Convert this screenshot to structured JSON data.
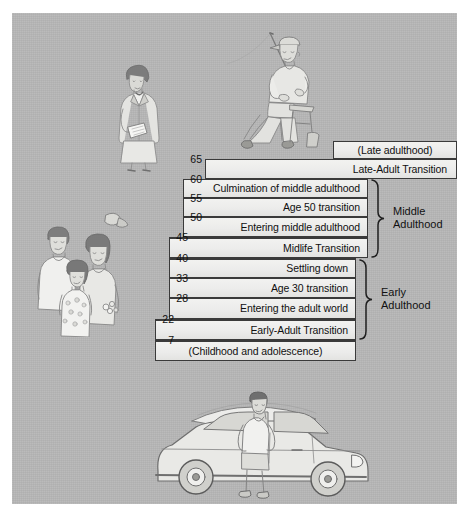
{
  "figure": {
    "background_color": "#b6b6b6",
    "bar_fill_color": "#ececea",
    "bar_border_color": "#3a3a3a"
  },
  "age_ticks": [
    {
      "value": "65"
    },
    {
      "value": "60"
    },
    {
      "value": "55"
    },
    {
      "value": "50"
    },
    {
      "value": "45"
    },
    {
      "value": "40"
    },
    {
      "value": "33"
    },
    {
      "value": "28"
    },
    {
      "value": "22"
    },
    {
      "value": "7"
    }
  ],
  "stages": [
    {
      "id": "late-adulthood",
      "label": "(Late adulthood)"
    },
    {
      "id": "late-adult-transition",
      "label": "Late-Adult Transition"
    },
    {
      "id": "culmination-middle",
      "label": "Culmination of middle adulthood"
    },
    {
      "id": "age-50-transition",
      "label": "Age 50 transition"
    },
    {
      "id": "entering-middle-adulthood",
      "label": "Entering middle adulthood"
    },
    {
      "id": "midlife-transition",
      "label": "Midlife Transition"
    },
    {
      "id": "settling-down",
      "label": "Settling down"
    },
    {
      "id": "age-30-transition",
      "label": "Age 30 transition"
    },
    {
      "id": "entering-adult-world",
      "label": "Entering the adult world"
    },
    {
      "id": "early-adult-transition",
      "label": "Early-Adult Transition"
    },
    {
      "id": "childhood-adolescence",
      "label": "(Childhood and adolescence)"
    }
  ],
  "era_labels": [
    {
      "id": "middle-adulthood",
      "line1": "Middle",
      "line2": "Adulthood"
    },
    {
      "id": "early-adulthood",
      "line1": "Early",
      "line2": "Adulthood"
    }
  ],
  "illustrations": [
    {
      "id": "businesswoman-illustration",
      "name": "woman-with-papers"
    },
    {
      "id": "fisherman-illustration",
      "name": "older-man-fishing"
    },
    {
      "id": "family-illustration",
      "name": "family-with-child"
    },
    {
      "id": "young-man-car-illustration",
      "name": "young-man-with-car-and-surfboards"
    }
  ]
}
